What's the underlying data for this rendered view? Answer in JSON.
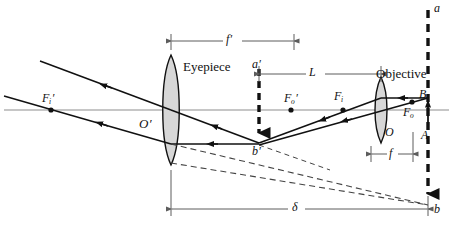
{
  "figure": {
    "background_color": "#ffffff",
    "ink_color": "#111111",
    "axis_color": "#8d8d8d",
    "lens_fill": "#d7d7d7",
    "width": 449,
    "height": 228
  },
  "labels": {
    "eyepiece": "Eyepiece",
    "objective": "Objective",
    "focal_image_eyepiece": {
      "base": "F",
      "sub": "i",
      "prime": "′"
    },
    "focal_object_eyepiece": {
      "base": "F",
      "sub": "o",
      "prime": "′"
    },
    "focal_image_objective": {
      "base": "F",
      "sub": "i",
      "prime": ""
    },
    "focal_object_objective": {
      "base": "F",
      "sub": "o",
      "prime": ""
    },
    "eyepiece_center": {
      "base": "O",
      "sub": "",
      "prime": "′"
    },
    "objective_center": {
      "base": "O",
      "sub": "",
      "prime": ""
    },
    "object_top": "B",
    "object_base": "A",
    "intermediate_image_top": {
      "base": "a",
      "prime": "′"
    },
    "intermediate_image_base": {
      "base": "b",
      "prime": "′"
    },
    "final_image_top": "a",
    "final_image_base": "b",
    "eyepiece_focal_length": {
      "base": "f",
      "prime": "′"
    },
    "objective_focal_length": {
      "base": "f",
      "prime": ""
    },
    "tube_length": "L",
    "optical_interval": "δ"
  },
  "dimension_lines": [
    {
      "name": "eyepiece-focal-length",
      "label": "f′",
      "from_x": 171,
      "to_x": 294,
      "y": 41
    },
    {
      "name": "tube-length",
      "label": "L",
      "from_x": 259,
      "to_x": 381,
      "y": 74
    },
    {
      "name": "objective-focal-length",
      "label": "f",
      "from_x": 371,
      "to_x": 413,
      "y": 154
    },
    {
      "name": "optical-interval",
      "label": "δ",
      "from_x": 171,
      "to_x": 428,
      "y": 209
    }
  ],
  "optical_elements": [
    {
      "name": "eyepiece-lens",
      "type": "biconvex-lens",
      "center_x": 171,
      "center_y": 110,
      "half_height": 55,
      "bulge": 9
    },
    {
      "name": "objective-lens",
      "type": "biconvex-lens",
      "center_x": 381,
      "center_y": 110,
      "half_height": 33,
      "bulge": 6
    },
    {
      "name": "optical-axis",
      "type": "axis",
      "y": 110,
      "from_x": 4,
      "to_x": 449
    },
    {
      "name": "object-arrow",
      "type": "solid-arrow-up",
      "x": 428,
      "base_y": 130,
      "tip_y": 98
    },
    {
      "name": "intermediate-image-arrow",
      "type": "dashed-arrow-down",
      "x": 259,
      "base_y": 69,
      "tip_y": 143
    },
    {
      "name": "final-image-arrow",
      "type": "dashed-arrow-down",
      "x": 428,
      "base_y": 10,
      "tip_y": 205
    }
  ],
  "ray_paths": [
    {
      "name": "ray-through-objective-center",
      "style": "solid"
    },
    {
      "name": "ray-parallel-to-axis",
      "style": "solid"
    },
    {
      "name": "ray-exiting-eyepiece-upper",
      "style": "solid"
    },
    {
      "name": "ray-exiting-eyepiece-lower",
      "style": "solid"
    },
    {
      "name": "virtual-image-construction-upper",
      "style": "dashed"
    },
    {
      "name": "virtual-image-construction-lower",
      "style": "dashed"
    }
  ]
}
